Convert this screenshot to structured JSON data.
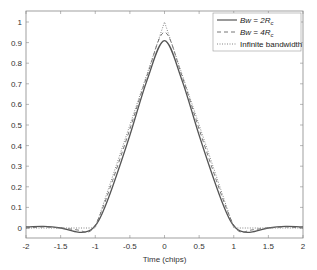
{
  "chart_data": {
    "type": "line",
    "title": "",
    "xlabel": "Time (chips)",
    "ylabel": "",
    "xlim": [
      -2,
      2
    ],
    "ylim": [
      -0.05,
      1.05
    ],
    "xticks": [
      -2,
      -1.5,
      -1,
      -0.5,
      0,
      0.5,
      1,
      1.5,
      2
    ],
    "xtick_labels": [
      "-2",
      "-1.5",
      "-1",
      "-0.5",
      "0",
      "0.5",
      "1",
      "1.5",
      "2"
    ],
    "yticks": [
      0,
      0.1,
      0.2,
      0.3,
      0.4,
      0.5,
      0.6,
      0.7,
      0.8,
      0.9,
      1
    ],
    "ytick_labels": [
      "0",
      "0.1",
      "0.2",
      "0.3",
      "0.4",
      "0.5",
      "0.6",
      "0.7",
      "0.8",
      "0.9",
      "1"
    ],
    "grid": false,
    "legend_position": "upper right",
    "series": [
      {
        "name": "Bw = 2Rc",
        "legend_main": "Bw = 2R",
        "legend_sub": "c",
        "style": "solid",
        "color": "#555555",
        "x": [
          -2,
          -1.75,
          -1.5,
          -1.25,
          -1.1,
          -1,
          -0.9,
          -0.75,
          -0.5,
          -0.25,
          0,
          0.25,
          0.5,
          0.75,
          0.9,
          1,
          1.1,
          1.25,
          1.5,
          1.75,
          2
        ],
        "y": [
          0.005,
          0.008,
          0.0,
          -0.02,
          -0.015,
          0.01,
          0.07,
          0.2,
          0.45,
          0.72,
          0.91,
          0.72,
          0.45,
          0.2,
          0.07,
          0.01,
          -0.015,
          -0.02,
          0.0,
          0.008,
          0.005
        ]
      },
      {
        "name": "Bw = 4Rc",
        "legend_main": "Bw = 4R",
        "legend_sub": "c",
        "style": "dashed",
        "color": "#666666",
        "x": [
          -2,
          -1.75,
          -1.5,
          -1.25,
          -1.1,
          -1,
          -0.9,
          -0.75,
          -0.5,
          -0.25,
          0,
          0.25,
          0.5,
          0.75,
          0.9,
          1,
          1.1,
          1.25,
          1.5,
          1.75,
          2
        ],
        "y": [
          0.0,
          0.005,
          0.0,
          -0.01,
          -0.02,
          0.015,
          0.09,
          0.23,
          0.48,
          0.74,
          0.95,
          0.74,
          0.48,
          0.23,
          0.09,
          0.015,
          -0.02,
          -0.01,
          0.0,
          0.005,
          0.0
        ]
      },
      {
        "name": "Infinite bandwidth",
        "legend_main": "Infinite bandwidth",
        "legend_sub": "",
        "style": "dotted",
        "color": "#777777",
        "x": [
          -2,
          -1,
          0,
          1,
          2
        ],
        "y": [
          0,
          0,
          1,
          0,
          0
        ]
      }
    ]
  }
}
